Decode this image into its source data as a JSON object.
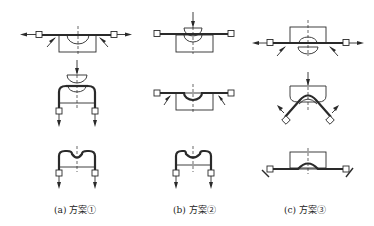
{
  "diagram": {
    "columns": [
      {
        "id": "a",
        "caption": "(a) 方案①",
        "steps": [
          "stretch-forming: strip pulled outward over lower die with side rollers",
          "upper punch descends onto bent strip",
          "final formed profile with downward pull"
        ]
      },
      {
        "id": "b",
        "caption": "(b) 方案②",
        "steps": [
          "upper punch descends on strip over lower die",
          "strip bent with side rollers",
          "final formed profile with downward pull"
        ]
      },
      {
        "id": "c",
        "caption": "(c) 方案③",
        "steps": [
          "inverted die above strip, lower punch below, strip pulled outward",
          "die pushes down, strip wrapped over punch with angled pulls",
          "final formed profile with angled holding"
        ]
      }
    ]
  }
}
